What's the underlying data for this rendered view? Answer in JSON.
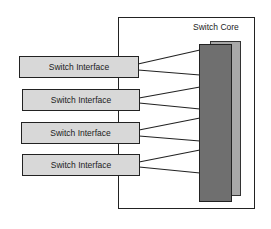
{
  "diagram": {
    "core": {
      "label": "Switch Core"
    },
    "interfaces": [
      {
        "label": "Switch Interface"
      },
      {
        "label": "Switch Interface"
      },
      {
        "label": "Switch Interface"
      },
      {
        "label": "Switch Interface"
      }
    ],
    "colors": {
      "interface_fill": "#d8d8d8",
      "core_bar_front": "#6f6f6f",
      "core_bar_back": "#a8a8a8",
      "stroke": "#222222"
    }
  }
}
